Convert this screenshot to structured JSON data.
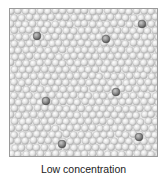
{
  "figure": {
    "caption": "Low concentration",
    "solvent_color": "#d9d9d9",
    "solute_color": "#8a8a8a",
    "border_color": "#9a9a9a",
    "sphere_radius": 3.6,
    "solute_particles": [
      {
        "x": 27,
        "y": 27
      },
      {
        "x": 96,
        "y": 30
      },
      {
        "x": 132,
        "y": 15
      },
      {
        "x": 36,
        "y": 92
      },
      {
        "x": 106,
        "y": 83
      },
      {
        "x": 52,
        "y": 135
      },
      {
        "x": 129,
        "y": 128
      }
    ],
    "solute_count": 7
  }
}
